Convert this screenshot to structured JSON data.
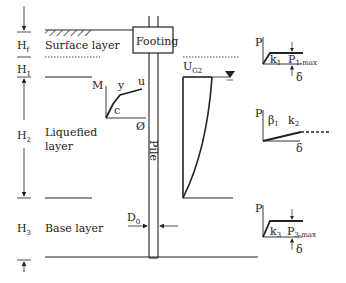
{
  "diagram": {
    "layers": [
      {
        "symbol": "H",
        "sub": "f",
        "name": "Surface layer"
      },
      {
        "symbol": "H",
        "sub": "1",
        "name": ""
      },
      {
        "symbol": "H",
        "sub": "2",
        "name_line1": "Liquefied",
        "name_line2": "layer"
      },
      {
        "symbol": "H",
        "sub": "3",
        "name": "Base layer"
      }
    ],
    "footing_label": "Footing",
    "pile_label": "Pile",
    "diameter": {
      "symbol": "D",
      "sub": "0"
    },
    "moment_curvature": {
      "y_axis": "M",
      "x_axis": "Ø",
      "points": [
        "c",
        "y",
        "u"
      ]
    },
    "ground_displacement": {
      "symbol": "U",
      "sub": "G2"
    },
    "springs": [
      {
        "p": "P",
        "k": "k",
        "k_sub": "1",
        "pmax": "P",
        "pmax_sub": "1-max",
        "delta": "δ"
      },
      {
        "p": "P",
        "beta": "β",
        "beta_sub": "1",
        "k": "k",
        "k_sub": "2",
        "delta": "δ"
      },
      {
        "p": "P",
        "k": "k",
        "k_sub": "3",
        "pmax": "P",
        "pmax_sub": "3-max",
        "delta": "δ"
      }
    ],
    "colors": {
      "line": "#222222",
      "background": "#ffffff"
    }
  }
}
